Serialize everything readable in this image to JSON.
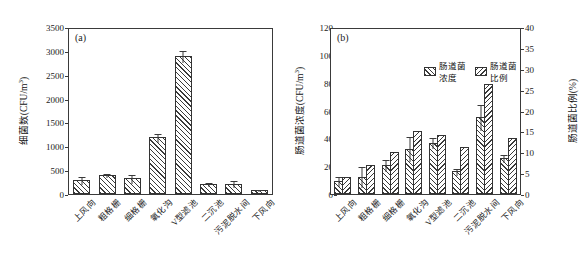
{
  "figure": {
    "panel_a_tag": "(a)",
    "panel_b_tag": "(b)"
  },
  "categories": [
    "上风向",
    "粗格栅",
    "细格栅",
    "氧化沟",
    "V型滤池",
    "二沉池",
    "污泥脱水间",
    "下风向"
  ],
  "legend": {
    "series1_label": "肠道菌浓度",
    "series2_label": "肠道菌比例",
    "swatch1_icon": "forward-hatch-swatch",
    "swatch2_icon": "backward-hatch-swatch"
  },
  "axes": {
    "a_ylabel": "细菌数(CFU/m",
    "a_ylabel_sup": "3",
    "a_ylabel_tail": ")",
    "a_yticks": [
      "3500",
      "3000",
      "2500",
      "2000",
      "1500",
      "1000",
      "500",
      "0"
    ],
    "b_ylabel_left": "肠道菌浓度(CFU/m",
    "b_ylabel_left_sup": "3",
    "b_ylabel_left_tail": ")",
    "b_yticks_left": [
      "120",
      "100",
      "80",
      "60",
      "40",
      "20",
      "0"
    ],
    "b_ylabel_right": "肠道菌比例(%)",
    "b_yticks_right": [
      "40",
      "35",
      "30",
      "25",
      "20",
      "15",
      "10",
      "5",
      "0"
    ]
  },
  "chart_data": [
    {
      "type": "bar",
      "panel": "(a)",
      "title": "",
      "xlabel": "",
      "ylabel": "细菌数(CFU/m3)",
      "ylim": [
        0,
        3500
      ],
      "ytick_step": 500,
      "grid": false,
      "categories": [
        "上风向",
        "粗格栅",
        "细格栅",
        "氧化沟",
        "V型滤池",
        "二沉池",
        "污泥脱水间",
        "下风向"
      ],
      "values": [
        300,
        400,
        330,
        1190,
        2890,
        210,
        215,
        85
      ],
      "errors": [
        80,
        40,
        90,
        90,
        120,
        45,
        70,
        18
      ],
      "hatch": "forward"
    },
    {
      "type": "bar",
      "panel": "(b)",
      "title": "",
      "xlabel": "",
      "ylabel": "肠道菌浓度(CFU/m3)",
      "ylim": [
        0,
        120
      ],
      "ytick_step": 20,
      "y2label": "肠道菌比例(%)",
      "y2lim": [
        0,
        40
      ],
      "y2tick_step": 5,
      "grid": false,
      "legend_position": "top-center",
      "categories": [
        "上风向",
        "粗格栅",
        "细格栅",
        "氧化沟",
        "V型滤池",
        "二沉池",
        "污泥脱水间",
        "下风向"
      ],
      "series": [
        {
          "name": "肠道菌浓度",
          "axis": "left",
          "hatch": "forward",
          "values": [
            9.5,
            12.5,
            21,
            32.5,
            37,
            16.5,
            55.5,
            26
          ],
          "errors": [
            3.5,
            7.5,
            4.5,
            9,
            4,
            2.5,
            9.5,
            3
          ]
        },
        {
          "name": "肠道菌比例",
          "axis": "right",
          "hatch": "backward",
          "values": [
            4.1,
            7.0,
            10.1,
            15.2,
            14.2,
            11.2,
            26.3,
            13.4
          ],
          "errors": [
            0,
            0,
            0,
            0,
            0,
            0,
            0,
            0
          ]
        }
      ]
    }
  ]
}
